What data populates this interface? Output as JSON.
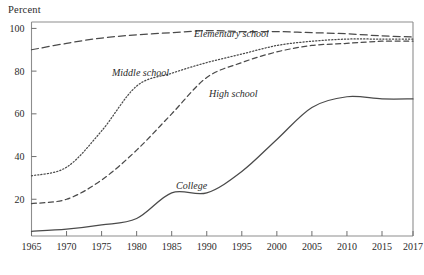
{
  "figure": {
    "y_axis_title": "Percent",
    "background_color": "#ffffff",
    "line_color": "#4a4a4a",
    "frame_color": "#8d8d8d"
  },
  "labels": {
    "elementary": "Elementary school",
    "middle": "Middle school",
    "high": "High school",
    "college": "College"
  },
  "chart_data": {
    "type": "line",
    "title": "",
    "subtitle": "",
    "xlabel": "",
    "ylabel": "Percent",
    "grid": false,
    "legend": "inline-annotations",
    "xlim": [
      1965,
      2017
    ],
    "ylim": [
      2.8,
      103
    ],
    "xticks": [
      1965,
      1970,
      1975,
      1980,
      1985,
      1990,
      1995,
      2000,
      2005,
      2010,
      2015,
      2017
    ],
    "xtick_labels": [
      "1965",
      "1970",
      "1975",
      "1980",
      "1985",
      "1990",
      "1995",
      "2000",
      "2005",
      "2010",
      "2015",
      "2017"
    ],
    "yticks": [
      20,
      40,
      60,
      80,
      100
    ],
    "ytick_labels": [
      "20",
      "40",
      "60",
      "80",
      "100"
    ],
    "x": [
      1965,
      1970,
      1975,
      1980,
      1985,
      1990,
      1995,
      2000,
      2005,
      2010,
      2015,
      2017
    ],
    "series": [
      {
        "name": "Elementary school",
        "style": "dashed",
        "values": [
          90,
          93,
          95.5,
          97,
          98,
          99,
          98.5,
          98.5,
          98,
          97.5,
          96.5,
          96
        ]
      },
      {
        "name": "Middle school",
        "style": "dotted",
        "values": [
          31,
          35,
          52,
          73,
          79,
          84,
          88,
          92,
          94,
          95,
          95,
          95
        ]
      },
      {
        "name": "High school",
        "style": "dashed-fine",
        "values": [
          18,
          20,
          29,
          43,
          60,
          77,
          84,
          89,
          92,
          93,
          94,
          94
        ]
      },
      {
        "name": "College",
        "style": "solid",
        "values": [
          5,
          6,
          8,
          11,
          23,
          23,
          33,
          48,
          63,
          68,
          67,
          67
        ]
      }
    ]
  }
}
